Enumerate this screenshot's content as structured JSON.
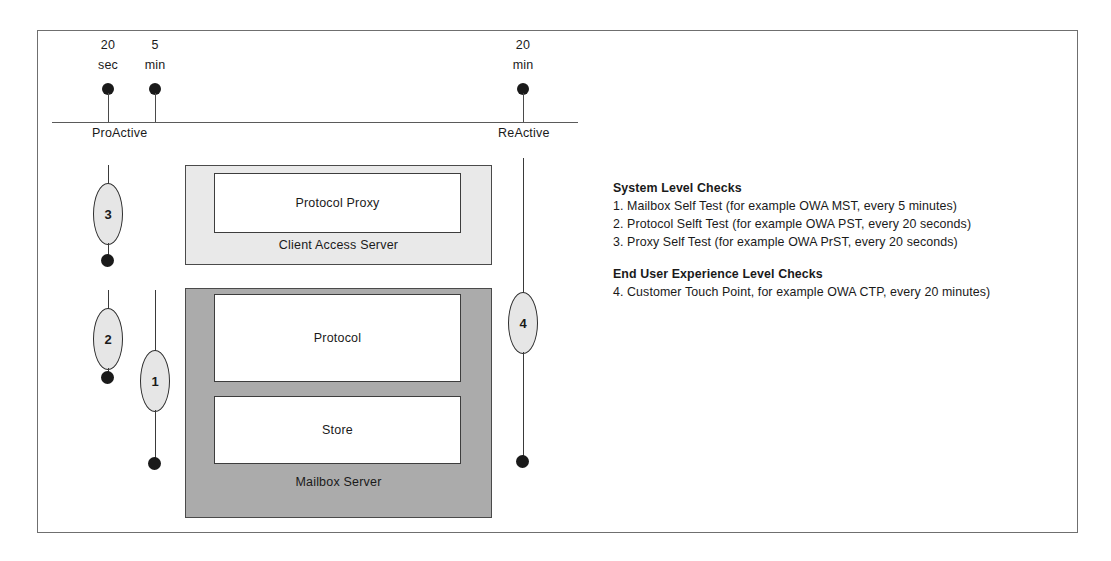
{
  "diagram": {
    "timeline": {
      "left_end_label": "ProActive",
      "right_end_label": "ReActive",
      "markers": [
        {
          "value": "20",
          "unit": "sec"
        },
        {
          "value": "5",
          "unit": "min"
        },
        {
          "value": "20",
          "unit": "min"
        }
      ]
    },
    "servers": [
      {
        "caption": "Client Access Server",
        "components": [
          "Protocol Proxy"
        ]
      },
      {
        "caption": "Mailbox Server",
        "components": [
          "Protocol",
          "Store"
        ]
      }
    ],
    "check_markers": [
      {
        "id": "1"
      },
      {
        "id": "2"
      },
      {
        "id": "3"
      },
      {
        "id": "4"
      }
    ],
    "legend": {
      "system_level": {
        "heading": "System Level Checks",
        "items": [
          "1. Mailbox Self Test (for example OWA MST, every 5 minutes)",
          "2. Protocol Selft Test (for example OWA PST, every 20 seconds)",
          "3. Proxy Self Test (for example OWA PrST, every 20 seconds)"
        ]
      },
      "end_user_level": {
        "heading": "End User Experience Level Checks",
        "items": [
          "4. Customer Touch Point, for example OWA CTP, every 20 minutes)"
        ]
      }
    },
    "colors": {
      "cas_fill": "#e9e9e9",
      "mailbox_fill": "#ababab",
      "component_fill": "#ffffff",
      "ellipse_fill": "#e6e6e6",
      "line": "#3a3a3a"
    }
  }
}
